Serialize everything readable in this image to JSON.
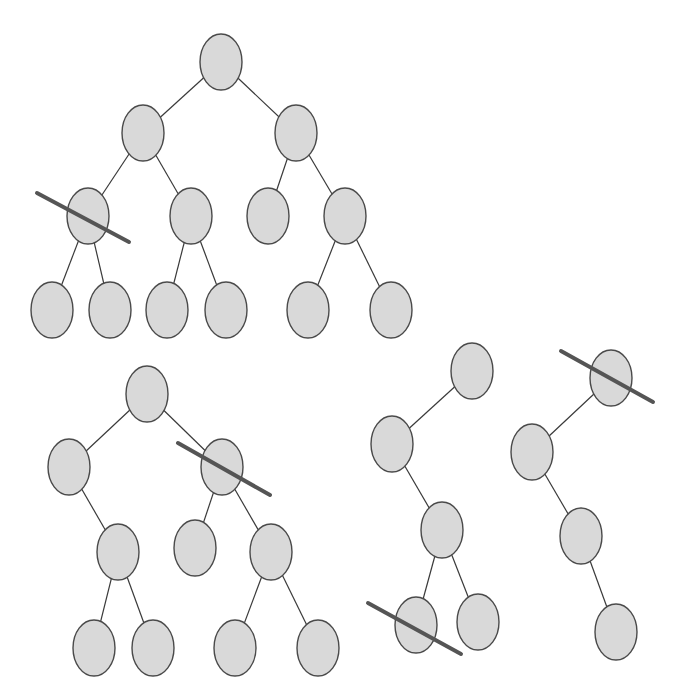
{
  "diagram": {
    "colors": {
      "node_fill": "#d9d9d9",
      "node_stroke": "#4a4a4a",
      "edge": "#3a3a3a",
      "cut": "#555555",
      "background": "#ffffff"
    },
    "node_rx": 21,
    "node_ry": 28,
    "trees": [
      {
        "id": "tree-1",
        "nodes": [
          {
            "id": "a",
            "x": 221,
            "y": 62
          },
          {
            "id": "b",
            "x": 143,
            "y": 133
          },
          {
            "id": "c",
            "x": 296,
            "y": 133
          },
          {
            "id": "d",
            "x": 88,
            "y": 216,
            "cut": true
          },
          {
            "id": "e",
            "x": 191,
            "y": 216
          },
          {
            "id": "f",
            "x": 268,
            "y": 216
          },
          {
            "id": "g",
            "x": 345,
            "y": 216
          },
          {
            "id": "h",
            "x": 52,
            "y": 310
          },
          {
            "id": "i",
            "x": 110,
            "y": 310
          },
          {
            "id": "j",
            "x": 167,
            "y": 310
          },
          {
            "id": "k",
            "x": 226,
            "y": 310
          },
          {
            "id": "l",
            "x": 308,
            "y": 310
          },
          {
            "id": "m",
            "x": 391,
            "y": 310
          }
        ],
        "edges": [
          [
            "a",
            "b"
          ],
          [
            "a",
            "c"
          ],
          [
            "b",
            "d"
          ],
          [
            "b",
            "e"
          ],
          [
            "c",
            "f"
          ],
          [
            "c",
            "g"
          ],
          [
            "d",
            "h"
          ],
          [
            "d",
            "i"
          ],
          [
            "e",
            "j"
          ],
          [
            "e",
            "k"
          ],
          [
            "g",
            "l"
          ],
          [
            "g",
            "m"
          ]
        ],
        "cuts": [
          {
            "x1": 37,
            "y1": 193,
            "x2": 129,
            "y2": 242
          }
        ]
      },
      {
        "id": "tree-2",
        "nodes": [
          {
            "id": "a",
            "x": 147,
            "y": 394
          },
          {
            "id": "b",
            "x": 69,
            "y": 467
          },
          {
            "id": "c",
            "x": 222,
            "y": 467,
            "cut": true
          },
          {
            "id": "d",
            "x": 118,
            "y": 552
          },
          {
            "id": "e",
            "x": 195,
            "y": 548
          },
          {
            "id": "f",
            "x": 271,
            "y": 552
          },
          {
            "id": "g",
            "x": 94,
            "y": 648
          },
          {
            "id": "h",
            "x": 153,
            "y": 648
          },
          {
            "id": "i",
            "x": 235,
            "y": 648
          },
          {
            "id": "j",
            "x": 318,
            "y": 648
          }
        ],
        "edges": [
          [
            "a",
            "b"
          ],
          [
            "a",
            "c"
          ],
          [
            "b",
            "d"
          ],
          [
            "c",
            "e"
          ],
          [
            "c",
            "f"
          ],
          [
            "d",
            "g"
          ],
          [
            "d",
            "h"
          ],
          [
            "f",
            "i"
          ],
          [
            "f",
            "j"
          ]
        ],
        "cuts": [
          {
            "x1": 178,
            "y1": 443,
            "x2": 270,
            "y2": 495
          }
        ]
      },
      {
        "id": "tree-3",
        "nodes": [
          {
            "id": "a",
            "x": 472,
            "y": 371
          },
          {
            "id": "b",
            "x": 392,
            "y": 444
          },
          {
            "id": "c",
            "x": 442,
            "y": 530
          },
          {
            "id": "d",
            "x": 416,
            "y": 625,
            "cut": true
          },
          {
            "id": "e",
            "x": 478,
            "y": 622
          }
        ],
        "edges": [
          [
            "a",
            "b"
          ],
          [
            "b",
            "c"
          ],
          [
            "c",
            "d"
          ],
          [
            "c",
            "e"
          ]
        ],
        "cuts": [
          {
            "x1": 368,
            "y1": 603,
            "x2": 461,
            "y2": 654
          }
        ]
      },
      {
        "id": "tree-4",
        "nodes": [
          {
            "id": "a",
            "x": 611,
            "y": 378,
            "cut": true
          },
          {
            "id": "b",
            "x": 532,
            "y": 452
          },
          {
            "id": "c",
            "x": 581,
            "y": 536
          },
          {
            "id": "d",
            "x": 616,
            "y": 632
          }
        ],
        "edges": [
          [
            "a",
            "b"
          ],
          [
            "b",
            "c"
          ],
          [
            "c",
            "d"
          ]
        ],
        "cuts": [
          {
            "x1": 561,
            "y1": 351,
            "x2": 653,
            "y2": 402
          }
        ]
      }
    ]
  }
}
